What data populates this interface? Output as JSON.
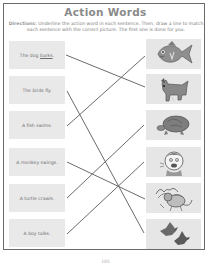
{
  "worksheet": {
    "title": "Action Words",
    "directions_lead": "Directions:",
    "directions_text": " Underline the action word in each sentence. Then, draw a line to match each sentence with the correct picture. The first one is done for you.",
    "page_number": "105"
  },
  "sentences": [
    {
      "before": "The dog ",
      "action": "barks",
      "after": ".",
      "underlined": true
    },
    {
      "before": "The birds fly.",
      "action": "",
      "after": "",
      "underlined": false
    },
    {
      "before": "A fish swims.",
      "action": "",
      "after": "",
      "underlined": false
    },
    {
      "before": "A monkey swings.",
      "action": "",
      "after": "",
      "underlined": false
    },
    {
      "before": "A turtle crawls.",
      "action": "",
      "after": "",
      "underlined": false
    },
    {
      "before": "A boy talks.",
      "action": "",
      "after": "",
      "underlined": false
    }
  ],
  "pictures": [
    {
      "name": "fish"
    },
    {
      "name": "dog"
    },
    {
      "name": "turtle"
    },
    {
      "name": "boy"
    },
    {
      "name": "monkey"
    },
    {
      "name": "birds"
    }
  ],
  "colors": {
    "line": "#5a5a5a",
    "box": "#e8e8e8",
    "title": "#8a8a8a"
  }
}
